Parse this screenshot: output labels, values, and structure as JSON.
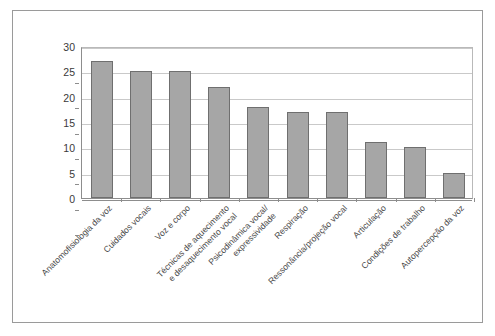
{
  "chart_data": {
    "type": "bar",
    "title": "",
    "subtitle": "",
    "xlabel": "",
    "ylabel": "",
    "ylim": [
      0,
      30
    ],
    "ytick_values": [
      0,
      5,
      10,
      15,
      20,
      25,
      30
    ],
    "ytick_labels": [
      "0",
      "5",
      "10",
      "15",
      "20",
      "25",
      "30"
    ],
    "grid": true,
    "legend": false,
    "legend_position": "none",
    "bar_fill_color": "#a6a6a6",
    "bar_border_color": "#6f6f6f",
    "gridline_color": "#c9c9c9",
    "axis_color": "#8d8d8d",
    "frame_color": "#9a9a9a",
    "background_color": "#ffffff",
    "categories": [
      "Anatomofisiologia da voz",
      "Cuidados vocais",
      "Voz e corpo",
      "Técnicas de aquecimento e desaquecimento vocal",
      "Psicodinâmica vocal/ expressividade",
      "Respiração",
      "Ressonância/projeção vocal",
      "Articulação",
      "Condições de trabalho",
      "Autopercepção da voz"
    ],
    "category_lines": [
      [
        "Anatomofisiologia da voz"
      ],
      [
        "Cuidados vocais"
      ],
      [
        "Voz e corpo"
      ],
      [
        "Técnicas de aquecimento",
        "e desaquecimento vocal"
      ],
      [
        "Psicodinâmica vocal/",
        "expressividade"
      ],
      [
        "Respiração"
      ],
      [
        "Ressonância/projeção vocal"
      ],
      [
        "Articulação"
      ],
      [
        "Condições de trabalho"
      ],
      [
        "Autopercepção da voz"
      ]
    ],
    "values": [
      27,
      25,
      25,
      22,
      18,
      17,
      17,
      11,
      10,
      5
    ]
  }
}
